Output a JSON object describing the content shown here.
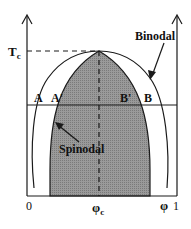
{
  "diagram": {
    "colors": {
      "background": "#ffffff",
      "line": "#1a1a1a",
      "spinodal_fill": "#8e8e8e"
    },
    "axes": {
      "y_label": "T",
      "y_critical_label": "T",
      "y_critical_subscript": "c",
      "x_left_label": "0",
      "x_critical_label": "φ",
      "x_critical_subscript": "c",
      "x_var_label": "φ",
      "x_right_label": "1"
    },
    "curves": {
      "binodal_label": "Binodal",
      "spinodal_label": "Spinodal"
    },
    "points": {
      "A": "A",
      "A_prime": "A'",
      "B_prime": "B'",
      "B": "B"
    }
  }
}
